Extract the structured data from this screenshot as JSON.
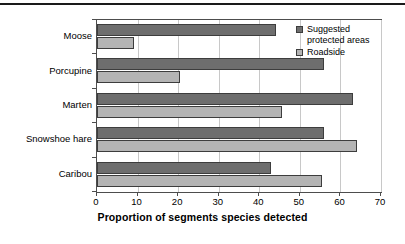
{
  "chart_data": {
    "type": "bar",
    "orientation": "horizontal",
    "title": "",
    "xlabel": "Proportion of segments species detected",
    "ylabel": "",
    "xlim": [
      0,
      70
    ],
    "xticks": [
      0,
      10,
      20,
      30,
      40,
      50,
      60,
      70
    ],
    "xtick_labels": [
      "0",
      "10",
      "20",
      "30",
      "40",
      "50",
      "60",
      "70"
    ],
    "grid": "vertical",
    "legend_position": "top-right",
    "categories": [
      "Moose",
      "Porcupine",
      "Marten",
      "Snowshoe hare",
      "Caribou"
    ],
    "series": [
      {
        "name": "Suggested protected areas",
        "color": "#6e6e6e",
        "values": [
          44,
          56,
          63,
          56,
          43
        ]
      },
      {
        "name": "Roadside",
        "color": "#b4b4b4",
        "values": [
          9,
          20.5,
          45.5,
          64,
          55.5
        ]
      }
    ]
  },
  "legend": {
    "items": [
      {
        "label": "Suggested protected areas",
        "color": "#6e6e6e"
      },
      {
        "label": "Roadside",
        "color": "#b4b4b4"
      }
    ]
  },
  "colors": {
    "series_dark": "#6e6e6e",
    "series_light": "#b4b4b4",
    "gridline": "#c8c8c8",
    "axis": "#4d4d4d",
    "rule": "#1a1a1a",
    "background": "#ffffff"
  }
}
